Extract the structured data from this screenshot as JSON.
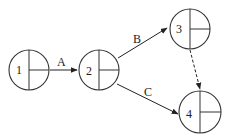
{
  "diagram": {
    "type": "activity-on-arrow network",
    "nodes": [
      {
        "id": "1",
        "label": "1"
      },
      {
        "id": "2",
        "label": "2"
      },
      {
        "id": "3",
        "label": "3"
      },
      {
        "id": "4",
        "label": "4"
      }
    ],
    "edges": [
      {
        "from": "1",
        "to": "2",
        "label": "A",
        "style": "solid"
      },
      {
        "from": "2",
        "to": "3",
        "label": "B",
        "style": "solid"
      },
      {
        "from": "2",
        "to": "4",
        "label": "C",
        "style": "solid"
      },
      {
        "from": "3",
        "to": "4",
        "label": "",
        "style": "dashed"
      }
    ]
  },
  "colors": {
    "stroke": "#333333",
    "background": "#ffffff"
  }
}
